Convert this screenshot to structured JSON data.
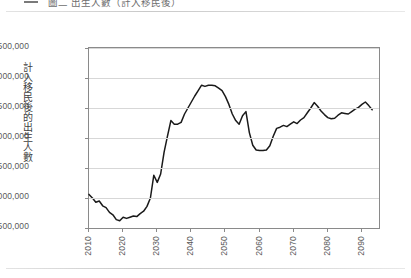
{
  "header": {
    "bullet_icon": "dash-icon",
    "title": "圖二  出生人數（計入移民後）"
  },
  "chart_data": {
    "type": "line",
    "title": "",
    "xlabel": "",
    "ylabel": "計入移民後的出生人數",
    "xlim": [
      2010,
      2095
    ],
    "ylim": [
      2500000,
      5500000
    ],
    "grid": true,
    "legend": false,
    "ytick_labels": [
      "5,500,000",
      "5,000,000",
      "4,500,000",
      "4,000,000",
      "3,500,000",
      "3,000,000",
      "2,500,000"
    ],
    "ytick_values": [
      5500000,
      5000000,
      4500000,
      4000000,
      3500000,
      3000000,
      2500000
    ],
    "xtick_labels": [
      "2010",
      "2020",
      "2030",
      "2040",
      "2050",
      "2060",
      "2070",
      "2080",
      "2090"
    ],
    "xtick_values": [
      2010,
      2020,
      2030,
      2040,
      2050,
      2060,
      2070,
      2080,
      2090
    ],
    "series": [
      {
        "name": "計入移民後的出生人數",
        "color": "#1a1a1a",
        "x": [
          2010,
          2011,
          2012,
          2013,
          2014,
          2015,
          2016,
          2017,
          2018,
          2019,
          2020,
          2021,
          2022,
          2023,
          2024,
          2025,
          2026,
          2027,
          2028,
          2029,
          2030,
          2031,
          2032,
          2033,
          2034,
          2035,
          2036,
          2037,
          2038,
          2039,
          2040,
          2041,
          2042,
          2043,
          2044,
          2045,
          2046,
          2047,
          2048,
          2049,
          2050,
          2051,
          2052,
          2053,
          2054,
          2055,
          2056,
          2057,
          2058,
          2059,
          2060,
          2061,
          2062,
          2063,
          2064,
          2065,
          2066,
          2067,
          2068,
          2069,
          2070,
          2071,
          2072,
          2073,
          2074,
          2075,
          2076,
          2077,
          2078,
          2079,
          2080,
          2081,
          2082,
          2083,
          2084,
          2085,
          2086,
          2087,
          2088,
          2089,
          2090,
          2091,
          2092,
          2093
        ],
        "values": [
          3060000,
          3000000,
          2930000,
          2950000,
          2870000,
          2840000,
          2760000,
          2720000,
          2640000,
          2620000,
          2680000,
          2660000,
          2680000,
          2700000,
          2690000,
          2740000,
          2780000,
          2860000,
          3000000,
          3380000,
          3260000,
          3400000,
          3760000,
          4030000,
          4290000,
          4230000,
          4230000,
          4260000,
          4400000,
          4500000,
          4600000,
          4700000,
          4790000,
          4880000,
          4860000,
          4880000,
          4880000,
          4870000,
          4830000,
          4790000,
          4690000,
          4560000,
          4400000,
          4290000,
          4230000,
          4370000,
          4440000,
          4090000,
          3880000,
          3800000,
          3790000,
          3790000,
          3800000,
          3870000,
          4030000,
          4160000,
          4180000,
          4210000,
          4190000,
          4230000,
          4270000,
          4240000,
          4300000,
          4340000,
          4420000,
          4500000,
          4590000,
          4530000,
          4450000,
          4390000,
          4340000,
          4320000,
          4330000,
          4380000,
          4420000,
          4410000,
          4400000,
          4440000,
          4480000,
          4510000,
          4560000,
          4600000,
          4540000,
          4470000
        ]
      }
    ]
  }
}
